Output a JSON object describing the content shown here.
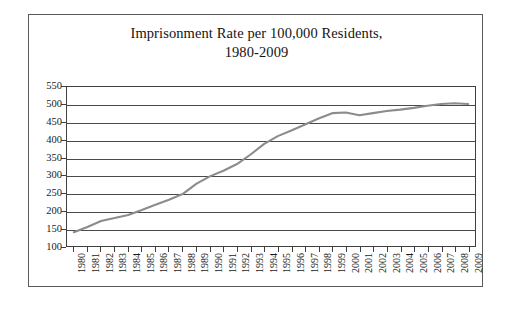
{
  "chart_data": {
    "type": "line",
    "title": "Imprisonment Rate per 100,000 Residents,",
    "title_line2": "1980-2009",
    "subtitle": "",
    "xlabel": "",
    "ylabel": "",
    "ylim": [
      100,
      550
    ],
    "ytick_step": 50,
    "yticks": [
      550,
      500,
      450,
      400,
      350,
      300,
      250,
      200,
      150,
      100
    ],
    "grid": true,
    "legend": "none",
    "line_color": "#8c8c8c",
    "frame_color": "#3f3f3f",
    "categories": [
      "1980",
      "1981",
      "1982",
      "1983",
      "1984",
      "1985",
      "1986",
      "1987",
      "1988",
      "1989",
      "1990",
      "1991",
      "1992",
      "1993",
      "1994",
      "1995",
      "1996",
      "1997",
      "1998",
      "1999",
      "2000",
      "2001",
      "2002",
      "2003",
      "2004",
      "2005",
      "2006",
      "2007",
      "2008",
      "2009"
    ],
    "values": [
      139,
      154,
      171,
      179,
      188,
      202,
      217,
      231,
      247,
      276,
      297,
      313,
      332,
      359,
      389,
      411,
      427,
      444,
      461,
      476,
      478,
      470,
      476,
      482,
      486,
      491,
      497,
      502,
      504,
      502
    ],
    "series": [
      {
        "name": "Imprisonment Rate",
        "values": [
          139,
          154,
          171,
          179,
          188,
          202,
          217,
          231,
          247,
          276,
          297,
          313,
          332,
          359,
          389,
          411,
          427,
          444,
          461,
          476,
          478,
          470,
          476,
          482,
          486,
          491,
          497,
          502,
          504,
          502
        ]
      }
    ]
  }
}
